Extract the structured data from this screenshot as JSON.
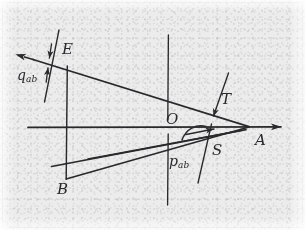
{
  "figure": {
    "kind": "geometric-line-diagram",
    "caption_present": false,
    "background_color": "#ececed",
    "ink_color": "#2a2a2c",
    "width": 305,
    "height": 230
  },
  "labels": {
    "E": "E",
    "O": "O",
    "A": "A",
    "B": "B",
    "T": "T",
    "S": "S",
    "q_main": "q",
    "q_sub": "ab",
    "p_main": "p",
    "p_sub": "ab"
  },
  "points": {
    "A": {
      "x": 249,
      "y": 127,
      "label": "A",
      "label_x": 255,
      "label_y": 136
    },
    "B": {
      "x": 66,
      "y": 179,
      "label": "B",
      "label_x": 58,
      "label_y": 183
    },
    "E": {
      "x": 53,
      "y": 62,
      "label": "E",
      "label_x": 62,
      "label_y": 42
    },
    "O": {
      "x": 168,
      "y": 127,
      "label": "O",
      "label_x": 166,
      "label_y": 112
    },
    "T": {
      "label": "T",
      "label_x": 220,
      "label_y": 94
    },
    "S": {
      "label": "S",
      "label_x": 212,
      "label_y": 146
    }
  },
  "annotations": [
    {
      "name": "q_ab",
      "text": "q",
      "sub": "ab",
      "x": 18,
      "y": 69,
      "kind": "measure-label"
    },
    {
      "name": "p_ab",
      "text": "p",
      "sub": "ab",
      "x": 170,
      "y": 156,
      "kind": "leader-label"
    }
  ],
  "lines": [
    {
      "name": "horizontal-axis",
      "x1": 28,
      "y1": 127,
      "x2": 290,
      "y2": 127,
      "arrow_end": true,
      "arrow_start": false
    },
    {
      "name": "vertical-axis",
      "x1": 168,
      "y1": 35,
      "x2": 168,
      "y2": 205,
      "arrow_end": false,
      "arrow_start": false
    },
    {
      "name": "upper-ray-E-to-A",
      "x1": 24,
      "y1": 57,
      "x2": 249,
      "y2": 127,
      "arrow_end": false,
      "arrow_start": true
    },
    {
      "name": "vertical-segment-through-E",
      "x1": 58,
      "y1": 30,
      "x2": 45,
      "y2": 102
    },
    {
      "name": "left-vertical-drop-B",
      "x1": 67,
      "y1": 65,
      "x2": 66,
      "y2": 179
    },
    {
      "name": "lower-ray-B-to-A",
      "x1": 66,
      "y1": 179,
      "x2": 249,
      "y2": 127
    },
    {
      "name": "lower-parallel-ray-upper",
      "x1": 53,
      "y1": 161,
      "x2": 249,
      "y2": 127
    },
    {
      "name": "lower-parallel-ray-lower",
      "x1": 50,
      "y1": 166,
      "x2": 245,
      "y2": 130
    },
    {
      "name": "slant-line-T-S",
      "x1": 228,
      "y1": 73,
      "x2": 198,
      "y2": 183
    }
  ],
  "arrows": [
    {
      "name": "q-measure-arrow-down",
      "direction": "down",
      "x": 50,
      "y_from": 44,
      "y_to": 62
    },
    {
      "name": "q-measure-arrow-up",
      "direction": "up",
      "x": 47,
      "y_from": 82,
      "y_to": 64
    },
    {
      "name": "axis-arrow-right",
      "direction": "right",
      "x": 290,
      "y": 127
    },
    {
      "name": "upper-ray-arrow-left",
      "direction": "left-up",
      "x": 24,
      "y": 57
    },
    {
      "name": "t-s-arrow-down",
      "direction": "down",
      "x": 212,
      "y": 118
    },
    {
      "name": "p-converge-arrow-right",
      "direction": "right",
      "x": 215,
      "y": 131
    }
  ]
}
